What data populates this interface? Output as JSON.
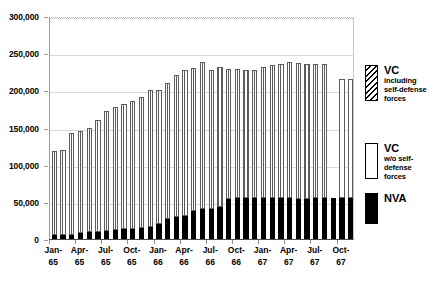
{
  "chart_data": {
    "type": "bar",
    "stacked": true,
    "title": "",
    "subtitle": "",
    "xlabel": "",
    "ylabel": "",
    "ylim": [
      0,
      300000
    ],
    "ytick_step": 50000,
    "ytick_labels": [
      "0",
      "50,000",
      "100,000",
      "150,000",
      "200,000",
      "250,000",
      "300,000"
    ],
    "ytick_values": [
      0,
      50000,
      100000,
      150000,
      200000,
      250000,
      300000
    ],
    "grid": true,
    "legend_position": "right",
    "categories": [
      "Jan-65",
      "Feb-65",
      "Mar-65",
      "Apr-65",
      "May-65",
      "Jun-65",
      "Jul-65",
      "Aug-65",
      "Sep-65",
      "Oct-65",
      "Nov-65",
      "Dec-65",
      "Jan-66",
      "Feb-66",
      "Mar-66",
      "Apr-66",
      "May-66",
      "Jun-66",
      "Jul-66",
      "Aug-66",
      "Sep-66",
      "Oct-66",
      "Nov-66",
      "Dec-66",
      "Jan-67",
      "Feb-67",
      "Mar-67",
      "Apr-67",
      "May-67",
      "Jun-67",
      "Jul-67",
      "Aug-67",
      "Sep-67",
      "Oct-67",
      "Nov-67"
    ],
    "xtick_labels": [
      {
        "line1": "Jan-",
        "line2": "65",
        "index": 0
      },
      {
        "line1": "Apr-",
        "line2": "65",
        "index": 3
      },
      {
        "line1": "Jul-",
        "line2": "65",
        "index": 6
      },
      {
        "line1": "Oct-",
        "line2": "65",
        "index": 9
      },
      {
        "line1": "Jan-",
        "line2": "66",
        "index": 12
      },
      {
        "line1": "Apr-",
        "line2": "66",
        "index": 15
      },
      {
        "line1": "Jul-",
        "line2": "66",
        "index": 18
      },
      {
        "line1": "Oct-",
        "line2": "66",
        "index": 21
      },
      {
        "line1": "Jan-",
        "line2": "67",
        "index": 24
      },
      {
        "line1": "Apr-",
        "line2": "67",
        "index": 27
      },
      {
        "line1": "Jul-",
        "line2": "67",
        "index": 30
      },
      {
        "line1": "Oct-",
        "line2": "67",
        "index": 33
      }
    ],
    "series": [
      {
        "name": "NVA",
        "key": "nva",
        "style": "solid-black",
        "color": "#000000",
        "values": [
          5000,
          5000,
          6000,
          8000,
          9000,
          10000,
          11000,
          12000,
          13000,
          14000,
          15000,
          16000,
          20000,
          27000,
          29000,
          31000,
          38000,
          40000,
          41000,
          43000,
          54000,
          55000,
          55000,
          55000,
          55000,
          55000,
          55000,
          55000,
          54000,
          54000,
          55000,
          55000,
          55000,
          55000,
          55000
        ]
      },
      {
        "name": "VC including self-defense forces",
        "key": "vc_incl",
        "style": "stipple-hatch",
        "color": "#5a5a5a",
        "values": [
          113000,
          115000,
          136000,
          137000,
          141000,
          150000,
          161000,
          166000,
          169000,
          172000,
          176000,
          184000,
          181000,
          183000,
          192000,
          196000,
          192000,
          198000,
          186000,
          188000,
          175000,
          174000,
          172000,
          173000,
          176000,
          179000,
          181000,
          183000,
          183000,
          181000,
          180000,
          181000,
          0,
          0,
          0
        ]
      },
      {
        "name": "VC w/o self-defense forces",
        "key": "vc_wo",
        "style": "white",
        "color": "#ffffff",
        "values": [
          0,
          0,
          0,
          0,
          0,
          0,
          0,
          0,
          0,
          0,
          0,
          0,
          0,
          0,
          0,
          0,
          0,
          0,
          0,
          0,
          0,
          0,
          0,
          0,
          0,
          0,
          0,
          0,
          0,
          0,
          0,
          0,
          0,
          160000,
          160000
        ]
      }
    ],
    "totals": [
      118000,
      120000,
      142000,
      145000,
      150000,
      160000,
      172000,
      178000,
      182000,
      186000,
      191000,
      200000,
      201000,
      210000,
      221000,
      227000,
      230000,
      238000,
      227000,
      231000,
      229000,
      229000,
      227000,
      228000,
      231000,
      234000,
      236000,
      238000,
      237000,
      235000,
      235000,
      236000,
      0,
      215000,
      215000
    ],
    "annotations": []
  },
  "legend": {
    "items": [
      {
        "name": "legend-vc-including",
        "swatch": "hatch",
        "title": "VC",
        "sub_lines": [
          "including",
          "self-defense",
          "forces"
        ]
      },
      {
        "name": "legend-vc-without",
        "swatch": "white",
        "title": "VC",
        "sub_lines": [
          "w/o self-",
          "defense",
          "forces"
        ]
      },
      {
        "name": "legend-nva",
        "swatch": "black",
        "title": "NVA",
        "sub_lines": []
      }
    ]
  }
}
